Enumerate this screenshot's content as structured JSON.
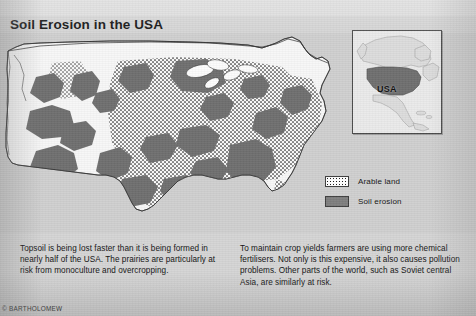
{
  "page": {
    "title": "Soil Erosion in the USA",
    "credit": "© BARTHOLOMEW"
  },
  "colors": {
    "background": "#d5d5d5",
    "header_band": "#dddddd",
    "land": "#f7f7f7",
    "erosion": "#6f6f6f",
    "arable_dot": "#1d1d1d",
    "ocean": "#d0d0d0",
    "outline": "#2e2e2e",
    "inset_usa": "#6f6f6f",
    "inset_land": "#dcdcdc"
  },
  "legend": {
    "items": [
      {
        "label": "Arable land",
        "pattern": "stipple",
        "swatch_color": "#ffffff"
      },
      {
        "label": "Soil erosion",
        "pattern": "solid",
        "swatch_color": "#7e7e7e"
      }
    ]
  },
  "inset": {
    "label": "USA",
    "region": "North America"
  },
  "captions": {
    "left": "Topsoil is being lost faster than it is being formed in nearly half of the USA. The prairies are particularly at risk from monoculture and overcropping.",
    "right": "To maintain crop yields farmers are using more chemical fertilisers. Not only is this expensive, it also causes pollution problems. Other parts of the world, such as Soviet central Asia, are similarly at risk."
  },
  "map": {
    "region": "United States of America",
    "features": [
      "national-border",
      "great-lakes",
      "coastline",
      "erosion-zones",
      "arable-zones"
    ]
  }
}
